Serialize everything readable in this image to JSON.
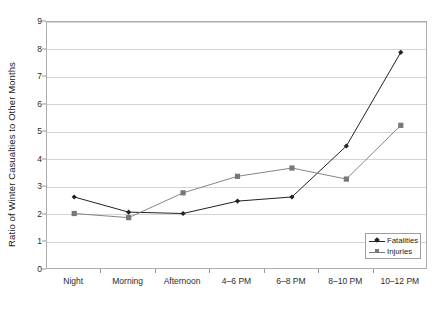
{
  "chart_data": {
    "type": "line",
    "title": "",
    "xlabel": "",
    "ylabel": "Ratio of Winter Casualties to Other Months",
    "categories": [
      "Night",
      "Morning",
      "Afternoon",
      "4–6 PM",
      "6–8 PM",
      "8–10 PM",
      "10–12 PM"
    ],
    "series": [
      {
        "name": "Fatalities",
        "marker": "diamond",
        "color": "#222222",
        "values": [
          2.65,
          2.1,
          2.05,
          2.5,
          2.65,
          4.5,
          7.9
        ]
      },
      {
        "name": "Injuries",
        "marker": "square",
        "color": "#777777",
        "values": [
          2.05,
          1.9,
          2.8,
          3.4,
          3.7,
          3.3,
          5.25
        ]
      }
    ],
    "ylim": [
      0,
      9
    ],
    "ytick_labels": [
      "0",
      "1",
      "2",
      "3",
      "4",
      "5",
      "6",
      "7",
      "8",
      "9"
    ],
    "ytick_values": [
      0,
      1,
      2,
      3,
      4,
      5,
      6,
      7,
      8,
      9
    ],
    "grid": "horizontal",
    "legend_position": "bottom-right-inside",
    "legend_entries": [
      "Fatalities",
      "Injuries"
    ]
  },
  "colors": {
    "fatalities": "#222222",
    "injuries": "#777777",
    "gridline": "#d4d4d4",
    "axis": "#adadad",
    "background": "#ffffff"
  }
}
